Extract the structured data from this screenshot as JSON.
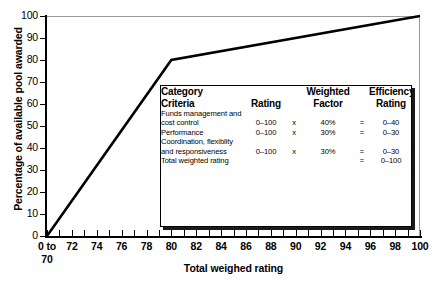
{
  "chart_data": {
    "type": "line",
    "title": "",
    "xlabel": "Total weighed rating",
    "ylabel": "Percentage of available pool awarded",
    "xlim": [
      70,
      100
    ],
    "ylim": [
      0,
      100
    ],
    "grid": false,
    "legend": "none",
    "x_tick_labels": [
      "0 to",
      "72",
      "74",
      "76",
      "78",
      "80",
      "82",
      "84",
      "86",
      "88",
      "90",
      "92",
      "94",
      "96",
      "98",
      "100"
    ],
    "x_tick_label_sub": "70",
    "x_tick_values": [
      70,
      72,
      74,
      76,
      78,
      80,
      82,
      84,
      86,
      88,
      90,
      92,
      94,
      96,
      98,
      100
    ],
    "x_minor_step": 1,
    "y_tick_values": [
      0,
      10,
      20,
      30,
      40,
      50,
      60,
      70,
      80,
      90,
      100
    ],
    "series": [
      {
        "name": "Percentage of available pool awarded",
        "color": "#000000",
        "points": [
          {
            "x": 70,
            "y": 0
          },
          {
            "x": 80,
            "y": 80
          },
          {
            "x": 100,
            "y": 100
          }
        ]
      }
    ]
  },
  "table": {
    "headers": {
      "category": "Category Criteria",
      "category_line1": "Category",
      "category_line2": "Criteria",
      "rating": "Rating",
      "weighted_factor": "Weighted Factor",
      "weighted_line1": "Weighted",
      "weighted_line2": "Factor",
      "efficiency": "Efficiency Rating",
      "efficiency_line1": "Efficiency",
      "efficiency_line2": "Rating"
    },
    "rows": [
      {
        "criteria": "Funds management and cost control",
        "rating": "0–100",
        "op1": "x",
        "weighted_factor": "40%",
        "op2": "=",
        "efficiency_rating": "0–40"
      },
      {
        "criteria": "Performance",
        "rating": "0–100",
        "op1": "x",
        "weighted_factor": "30%",
        "op2": "=",
        "efficiency_rating": "0–30"
      },
      {
        "criteria": "Coordination, flexiblity and responsiveness",
        "rating": "0–100",
        "op1": "x",
        "weighted_factor": "30%",
        "op2": "=",
        "efficiency_rating": "0–30"
      },
      {
        "criteria": "Total weighted rating",
        "rating": "",
        "op1": "",
        "weighted_factor": "",
        "op2": "=",
        "efficiency_rating": "0–100"
      }
    ]
  },
  "colors": {
    "line": "#000000",
    "axis": "#000000",
    "frame": "#9a9a9a",
    "table_border": "#000000",
    "table_shadow": "#1a1a1a",
    "background": "#ffffff"
  }
}
